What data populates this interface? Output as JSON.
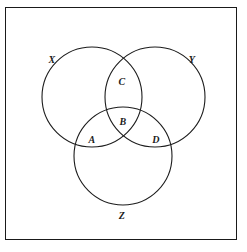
{
  "figure": {
    "type": "venn-diagram",
    "background_color": "#ffffff",
    "stroke_color": "#1c1c1c",
    "frame": {
      "x": 5,
      "y": 7,
      "width": 232,
      "height": 233,
      "border_color": "#1a1a1a"
    }
  },
  "chart_data": {
    "type": "diagram",
    "diagram_type": "venn",
    "title": "",
    "sets": [
      {
        "label": "X",
        "cx": 92,
        "cy": 97,
        "r": 50,
        "label_x": 52,
        "label_y": 60
      },
      {
        "label": "Y",
        "cx": 155,
        "cy": 97,
        "r": 50,
        "label_x": 192,
        "label_y": 60
      },
      {
        "label": "Z",
        "cx": 123,
        "cy": 156,
        "r": 49,
        "label_x": 122,
        "label_y": 216
      }
    ],
    "regions": [
      {
        "label": "A",
        "x": 92,
        "y": 140,
        "meaning": "X and Z only"
      },
      {
        "label": "B",
        "x": 123,
        "y": 122,
        "meaning": "X and Y and Z"
      },
      {
        "label": "C",
        "x": 122,
        "y": 82,
        "meaning": "X and Y only"
      },
      {
        "label": "D",
        "x": 156,
        "y": 140,
        "meaning": "Y and Z only"
      }
    ]
  },
  "labels": {
    "set_x": "X",
    "set_y": "Y",
    "set_z": "Z",
    "region_a": "A",
    "region_b": "B",
    "region_c": "C",
    "region_d": "D"
  }
}
